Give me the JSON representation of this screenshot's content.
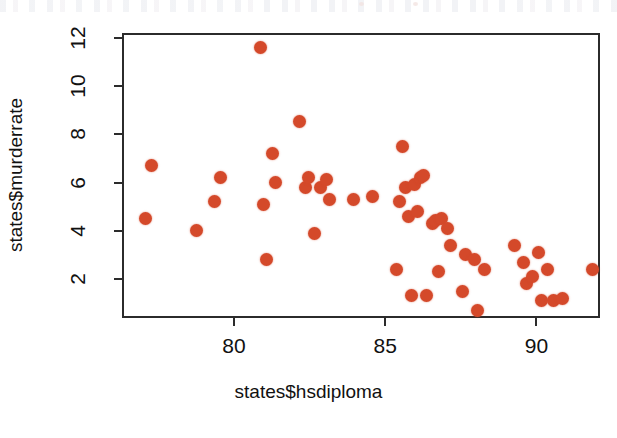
{
  "chart_data": {
    "type": "scatter",
    "title": "",
    "xlabel": "states$hsdiploma",
    "ylabel": "states$murderrate",
    "xlim": [
      76.3,
      92.1
    ],
    "ylim": [
      0.4,
      12.2
    ],
    "xticks": [
      80,
      85,
      90
    ],
    "xticklabels": [
      "80",
      "85",
      "90"
    ],
    "yticks": [
      2,
      4,
      6,
      8,
      10,
      12
    ],
    "yticklabels": [
      "2",
      "4",
      "6",
      "8",
      "10",
      "12"
    ],
    "grid": false,
    "legend": false,
    "point_color": "#d4492a",
    "point_shape": "filled-circle",
    "frame": "box",
    "n_points": 51,
    "x": [
      77.0,
      77.2,
      78.7,
      79.3,
      79.5,
      80.8,
      80.9,
      81.0,
      81.2,
      81.3,
      82.1,
      82.3,
      82.4,
      82.6,
      82.8,
      83.0,
      83.1,
      83.9,
      84.5,
      85.3,
      85.4,
      85.5,
      85.6,
      85.7,
      85.8,
      85.9,
      86.0,
      86.1,
      86.2,
      86.3,
      86.5,
      86.6,
      86.7,
      86.8,
      87.0,
      87.1,
      87.5,
      87.6,
      87.9,
      88.0,
      88.2,
      89.2,
      89.5,
      89.6,
      89.8,
      90.0,
      90.1,
      90.3,
      90.5,
      90.8,
      91.8
    ],
    "y": [
      4.6,
      6.8,
      4.1,
      5.3,
      6.3,
      11.7,
      5.2,
      2.9,
      7.3,
      6.1,
      8.6,
      5.9,
      6.3,
      4.0,
      5.9,
      6.2,
      5.4,
      5.4,
      5.5,
      2.5,
      5.3,
      7.6,
      5.9,
      4.7,
      1.4,
      6.0,
      4.9,
      6.3,
      6.4,
      1.4,
      4.4,
      4.5,
      2.4,
      4.6,
      4.2,
      3.5,
      1.6,
      3.1,
      2.9,
      0.8,
      2.5,
      3.5,
      2.8,
      1.9,
      2.2,
      3.2,
      1.2,
      2.5,
      1.2,
      1.3,
      2.5
    ]
  },
  "axes": {
    "x_tick_labels": [
      "80",
      "85",
      "90"
    ],
    "y_tick_labels": [
      "2",
      "4",
      "6",
      "8",
      "10",
      "12"
    ],
    "x_axis_title": "states$hsdiploma",
    "y_axis_title": "states$murderrate"
  }
}
